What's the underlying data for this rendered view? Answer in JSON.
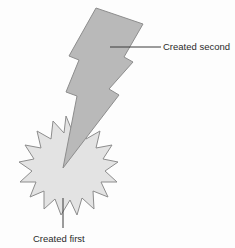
{
  "diagram": {
    "background_color": "#fdfdfd",
    "shapes": {
      "starburst": {
        "name": "starburst",
        "label": "Created first",
        "fill_color": "#e3e3e3",
        "stroke_color": "#8d8d8d",
        "points": 16,
        "center_x": 66,
        "center_y": 168,
        "outer_radius": 52,
        "inner_radius": 38
      },
      "lightning_bolt": {
        "name": "lightning-bolt",
        "label": "Created second",
        "fill_color": "#b9b9b9",
        "stroke_color": "#8d8d8d",
        "tip_x": 63,
        "tip_y": 168
      }
    },
    "callouts": [
      {
        "id": "callout-second",
        "text": "Created second",
        "leader_from_x": 110,
        "leader_from_y": 47,
        "leader_to_x": 161,
        "leader_to_y": 47,
        "text_x": 163,
        "text_y": 50,
        "line_color": "#3a3a3a"
      },
      {
        "id": "callout-first",
        "text": "Created first",
        "leader_from_x": 63,
        "leader_from_y": 198,
        "leader_to_x": 63,
        "leader_to_y": 228,
        "text_x": 33,
        "text_y": 242,
        "line_color": "#3a3a3a"
      }
    ]
  }
}
